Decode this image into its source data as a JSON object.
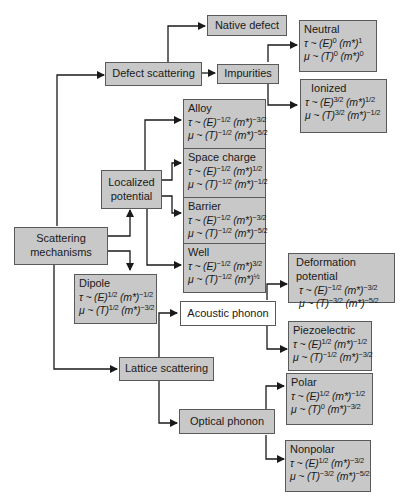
{
  "diagram": {
    "root": "Scattering\nmechanisms",
    "nodes": {
      "defect_scattering": "Defect scattering",
      "native_defect": "Native defect",
      "impurities": "Impurities",
      "localized_potential": "Localized\npotential",
      "lattice_scattering": "Lattice scattering",
      "acoustic_phonon": "Acoustic phonon",
      "optical_phonon": "Optical phonon"
    },
    "formula_boxes": {
      "neutral": {
        "title": "Neutral",
        "tau": "τ ~ (E)^0 (m*)^1",
        "mu": "μ ~ (T)^0 (m*)^0",
        "tau_parts": {
          "E": "0",
          "m": "1"
        },
        "mu_parts": {
          "T": "0",
          "m": "0"
        }
      },
      "ionized": {
        "title": "Ionized",
        "tau": "τ ~ (E)^3/2 (m*)^1/2",
        "mu": "μ ~ (T)^3/2 (m*)^-1/2",
        "tau_parts": {
          "E": "3/2",
          "m": "1/2"
        },
        "mu_parts": {
          "T": "3/2",
          "m": "−1/2"
        }
      },
      "alloy": {
        "title": "Alloy",
        "tau": "τ ~ (E)^-1/2 (m*)^-3/2",
        "mu": "μ ~ (T)^-1/2 (m*)^-5/2",
        "tau_parts": {
          "E": "−1/2",
          "m": "−3/2"
        },
        "mu_parts": {
          "T": "−1/2",
          "m": "−5/2"
        }
      },
      "space_charge": {
        "title": "Space charge",
        "tau": "τ ~ (E)^-1/2 (m*)^1/2",
        "mu": "μ ~ (T)^-1/2 (m*)^-1/2",
        "tau_parts": {
          "E": "−1/2",
          "m": "1/2"
        },
        "mu_parts": {
          "T": "−1/2",
          "m": "−1/2"
        }
      },
      "barrier": {
        "title": "Barrier",
        "tau": "τ ~ (E)^-1/2 (m*)^-3/2",
        "mu": "μ ~ (T)^-1/2 (m*)^-5/2",
        "tau_parts": {
          "E": "−1/2",
          "m": "−3/2"
        },
        "mu_parts": {
          "T": "−1/2",
          "m": "−5/2"
        }
      },
      "well": {
        "title": "Well",
        "tau": "τ ~ (E)^-1/2 (m*)^3/2",
        "mu": "μ ~ (T)^-1/2 (m*)^½",
        "tau_parts": {
          "E": "−1/2",
          "m": "3/2"
        },
        "mu_parts": {
          "T": "−1/2",
          "m": "½"
        }
      },
      "dipole": {
        "title": "Dipole",
        "tau": "τ ~ (E)^1/2 (m*)^-1/2",
        "mu": "μ ~ (T)^1/2 (m*)^-3/2",
        "tau_parts": {
          "E": "1/2",
          "m": "−1/2"
        },
        "mu_parts": {
          "T": "1/2",
          "m": "−3/2"
        }
      },
      "deformation_potential": {
        "title": "Deformation potential",
        "tau": "τ ~ (E)^-1/2 (m*)^-3/2",
        "mu": "μ ~ (T)^-3/2 (m*)^-5/2",
        "tau_parts": {
          "E": "−1/2",
          "m": "−3/2"
        },
        "mu_parts": {
          "T": "−3/2",
          "m": "−5/2"
        }
      },
      "piezoelectric": {
        "title": "Piezoelectric",
        "tau": "τ ~ (E)^1/2 (m*)^-1/2",
        "mu": "μ ~ (T)^-1/2 (m*)^-3/2",
        "tau_parts": {
          "E": "1/2",
          "m": "−1/2"
        },
        "mu_parts": {
          "T": "−1/2",
          "m": "−3/2"
        }
      },
      "polar": {
        "title": "Polar",
        "tau": "τ ~ (E)^1/2 (m*)^-1/2",
        "mu": "μ ~ (T)^0 (m*)^-3/2",
        "tau_parts": {
          "E": "1/2",
          "m": "−1/2"
        },
        "mu_parts": {
          "T": "0",
          "m": "−3/2"
        }
      },
      "nonpolar": {
        "title": "Nonpolar",
        "tau": "τ ~ (E)^1/2 (m*)^-3/2",
        "mu": "μ ~ (T)^-3/2 (m*)^-5/2",
        "tau_parts": {
          "E": "1/2",
          "m": "−3/2"
        },
        "mu_parts": {
          "T": "−3/2",
          "m": "−5/2"
        }
      }
    },
    "symbols": {
      "tau": "τ",
      "mu": "μ",
      "tilde": "~",
      "E": "E",
      "T": "T",
      "m": "m*"
    },
    "colors": {
      "box_fill": "#c8c8c8",
      "box_border": "#5a5a5a",
      "line": "#1a1a1a",
      "white_box": "#ffffff"
    }
  }
}
